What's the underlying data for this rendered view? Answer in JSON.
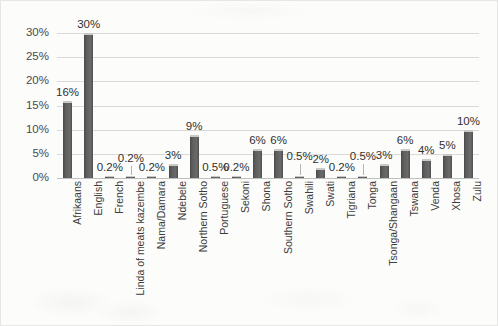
{
  "chart_data": {
    "type": "bar",
    "title": "",
    "xlabel": "",
    "ylabel": "",
    "ylim": [
      0,
      30
    ],
    "ytick_labels": [
      "0%",
      "5%",
      "10%",
      "15%",
      "20%",
      "25%",
      "30%"
    ],
    "ytick_values": [
      0,
      5,
      10,
      15,
      20,
      25,
      30
    ],
    "grid": true,
    "legend": "none",
    "categories": [
      "Afrikaans",
      "English",
      "French",
      "Linda of meats kazembe",
      "Nama/Damara",
      "Ndebele",
      "Northern Sotho",
      "Portuguese",
      "Sekoni",
      "Shona",
      "Southern Sotho",
      "Swahili",
      "Swati",
      "Tigriana",
      "Tonga",
      "Tsonga/Shangaan",
      "Tswana",
      "Venda",
      "Xhosa",
      "Zulu"
    ],
    "values": [
      16,
      30,
      0.2,
      0.2,
      0.2,
      3,
      9,
      0.5,
      0.2,
      6,
      6,
      0.5,
      2,
      0.2,
      0.5,
      3,
      6,
      4,
      5,
      10
    ],
    "data_labels": [
      "16%",
      "30%",
      "0.2%",
      "0.2%",
      "0.2%",
      "3%",
      "9%",
      "0.5%",
      "0.2%",
      "6%",
      "6%",
      "0.5%",
      "2%",
      "0.2%",
      "0.5%",
      "3%",
      "6%",
      "4%",
      "5%",
      "10%"
    ],
    "bar_color": "#5e5e5e",
    "grid_color": "#d9d9d7",
    "background_color": "#fcfcfa"
  }
}
